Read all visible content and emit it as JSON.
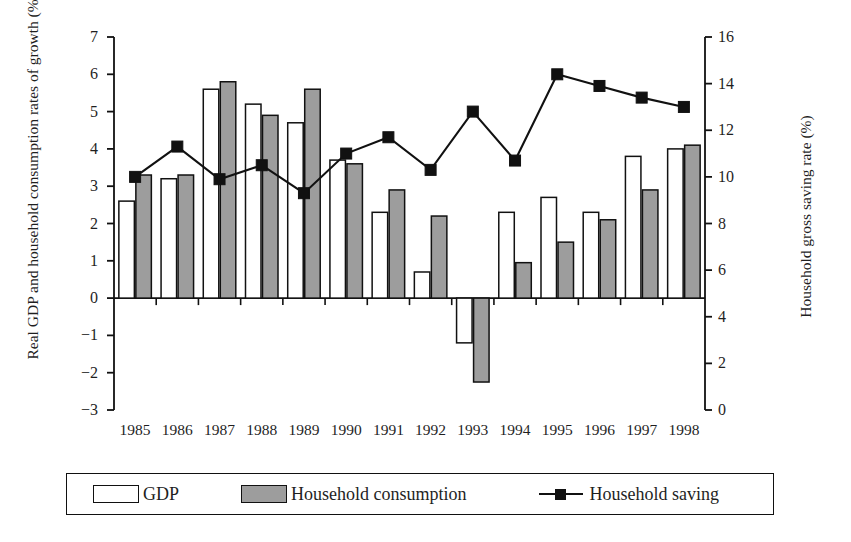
{
  "chart_data": {
    "type": "bar",
    "title": "",
    "subtitle": "",
    "categories": [
      "1985",
      "1986",
      "1987",
      "1988",
      "1989",
      "1990",
      "1991",
      "1992",
      "1993",
      "1994",
      "1995",
      "1996",
      "1997",
      "1998"
    ],
    "xlabel": "",
    "ylabel": "Real GDP and household consumption rates of growth (%)",
    "y2label": "Household gross saving rate (%)",
    "ylim": [
      -3,
      7
    ],
    "y2lim": [
      0,
      16
    ],
    "yticks": [
      -3,
      -2,
      -1,
      0,
      1,
      2,
      3,
      4,
      5,
      6,
      7
    ],
    "ytick_labels": [
      "−3",
      "−2",
      "−1",
      "0",
      "1",
      "2",
      "3",
      "4",
      "5",
      "6",
      "7"
    ],
    "y2ticks": [
      0,
      2,
      4,
      6,
      8,
      10,
      12,
      14,
      16
    ],
    "y2tick_labels": [
      "0",
      "2",
      "4",
      "6",
      "8",
      "10",
      "12",
      "14",
      "16"
    ],
    "grid": false,
    "legend_position": "bottom",
    "series": [
      {
        "name": "GDP",
        "type": "bar",
        "axis": "left",
        "color": "#ffffff",
        "edge_color": "#111111",
        "values": [
          2.6,
          3.2,
          5.6,
          5.2,
          4.7,
          3.7,
          2.3,
          0.7,
          -1.2,
          2.3,
          2.7,
          2.3,
          3.8,
          4.0
        ]
      },
      {
        "name": "Household consumption",
        "type": "bar",
        "axis": "left",
        "color": "#9d9d9d",
        "edge_color": "#111111",
        "values": [
          3.3,
          3.3,
          5.8,
          4.9,
          5.6,
          3.6,
          2.9,
          2.2,
          -2.25,
          0.95,
          1.5,
          2.1,
          2.9,
          4.1
        ]
      },
      {
        "name": "Household saving",
        "type": "line",
        "axis": "right",
        "color": "#111111",
        "marker": "square",
        "values": [
          10.0,
          11.3,
          9.9,
          10.5,
          9.3,
          11.0,
          11.7,
          10.3,
          12.8,
          10.7,
          14.4,
          13.9,
          13.4,
          13.0
        ]
      }
    ]
  },
  "legend": {
    "entries": [
      {
        "label": "GDP",
        "swatch": "white-bar"
      },
      {
        "label": "Household consumption",
        "swatch": "gray-bar"
      },
      {
        "label": "Household saving",
        "swatch": "line-square-marker"
      }
    ]
  },
  "colors": {
    "gdp_fill": "#ffffff",
    "consumption_fill": "#9d9d9d",
    "saving_line": "#111111",
    "axis": "#111111",
    "background": "#ffffff"
  }
}
